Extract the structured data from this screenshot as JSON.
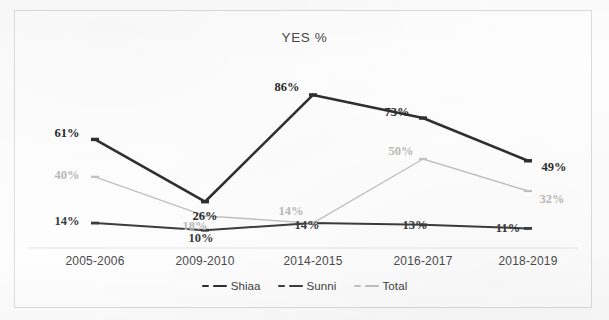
{
  "chart_data": {
    "type": "line",
    "title": "YES %",
    "xlabel": "",
    "ylabel": "",
    "ylim": [
      0,
      100
    ],
    "grid": false,
    "legend_position": "bottom",
    "categories": [
      "2005-2006",
      "2009-2010",
      "2014-2015",
      "2016-2017",
      "2018-2019"
    ],
    "series": [
      {
        "name": "Shiaa",
        "color": "#2f2f2f",
        "values": [
          61,
          26,
          86,
          73,
          49
        ],
        "labels": [
          "61%",
          "26%",
          "86%",
          "73%",
          "49%"
        ]
      },
      {
        "name": "Sunni",
        "color": "#3d3d3d",
        "values": [
          14,
          10,
          14,
          13,
          11
        ],
        "labels": [
          "14%",
          "10%",
          "14%",
          "13%",
          "11%"
        ]
      },
      {
        "name": "Total",
        "color": "#c2c2c2",
        "values": [
          40,
          18,
          14,
          50,
          32
        ],
        "labels": [
          "40%",
          "18%",
          "14%",
          "50%",
          "32%"
        ]
      }
    ]
  },
  "legend": {
    "items": [
      {
        "label": "Shiaa",
        "color": "#2f2f2f"
      },
      {
        "label": "Sunni",
        "color": "#3d3d3d"
      },
      {
        "label": "Total",
        "color": "#c2c2c2"
      }
    ]
  },
  "axis": {
    "categories": [
      "2005-2006",
      "2009-2010",
      "2014-2015",
      "2016-2017",
      "2018-2019"
    ]
  },
  "colors": {
    "shiaa": "#2f2f2f",
    "sunni": "#3d3d3d",
    "total": "#c2c2c2",
    "axis_line": "#e2e2e2",
    "frame": "#dcdcdc",
    "background": "#fefefe",
    "title_text": "#474747"
  }
}
